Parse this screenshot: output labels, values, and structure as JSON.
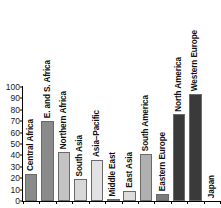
{
  "chart_data": {
    "type": "bar",
    "title": "",
    "xlabel": "",
    "ylabel": "",
    "ylim": [
      0,
      100
    ],
    "ytick_step": 10,
    "grid": false,
    "legend": "none",
    "orientation": "vertical",
    "label_rotation": 90,
    "yticks": [
      "100",
      "90",
      "80",
      "70",
      "60",
      "50",
      "40",
      "30",
      "20",
      "10",
      "0"
    ],
    "categories": [
      "Central Africa",
      "E. and S. Africa",
      "Northern Africa",
      "South Asia",
      "Asia–Pacific",
      "Middle East",
      "East Asia",
      "South America",
      "Eastern Europe",
      "North America",
      "Western Europe",
      "Japan"
    ],
    "values": [
      24,
      70,
      43,
      19,
      36,
      1.5,
      9,
      41,
      6,
      76,
      94,
      0
    ],
    "bar_colors": [
      "#8a8a8a",
      "#8a8a8a",
      "#c4c4c4",
      "#d8d8d8",
      "#e2e2e2",
      "#4a4a4a",
      "#dcdcdc",
      "#b0b0b0",
      "#7a7a7a",
      "#3a3a3a",
      "#3a3a3a",
      "#ffffff"
    ],
    "axis_color": "#000000",
    "text_color": "#111111"
  }
}
